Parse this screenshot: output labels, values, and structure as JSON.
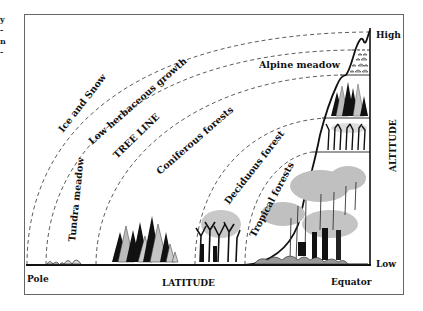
{
  "figure": {
    "caption_fragment": [
      "y",
      "-",
      "n",
      "-"
    ],
    "axes": {
      "x_label": "LATITUDE",
      "x_left": "Pole",
      "x_right": "Equator",
      "y_label": "ALTITUDE",
      "y_top": "High",
      "y_bottom": "Low"
    },
    "latitude_zones": [
      {
        "label": "Ice and Snow"
      },
      {
        "label": "Tundra meadow"
      },
      {
        "label": "Low herbaceous growth"
      },
      {
        "label": "TREE LINE"
      },
      {
        "label": "Coniferous forests"
      },
      {
        "label": "Deciduous forest"
      },
      {
        "label": "Tropical forests"
      }
    ],
    "altitude_zones": [
      {
        "label": "Alpine meadow"
      }
    ],
    "colors": {
      "ink": "#111111",
      "foliage_gray": "#bfbfbf",
      "frame": "#555555",
      "background": "#ffffff"
    }
  }
}
